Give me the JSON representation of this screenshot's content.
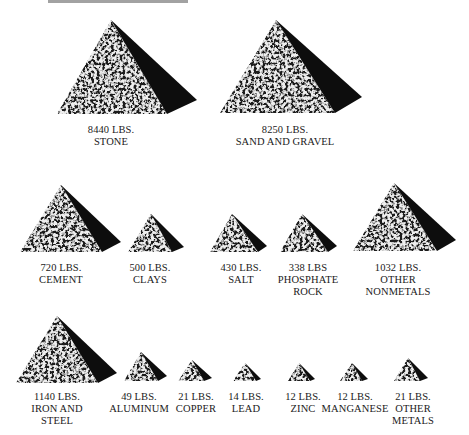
{
  "title": {
    "visible_text": "",
    "note": "cropped off top edge"
  },
  "colors": {
    "background": "#ffffff",
    "text": "#1a1a1a",
    "pyramid_shadow": "#0d0d0d",
    "pyramid_texture_light": "#e8e8e8",
    "pyramid_texture_dark": "#1c1c1c"
  },
  "unit": "LBS.",
  "rows": [
    {
      "items": [
        {
          "id": "stone",
          "amount": "8440 LBS.",
          "name_lines": [
            "STONE"
          ],
          "value": 8440,
          "apex": [
            111,
            20
          ],
          "left": [
            57,
            114
          ],
          "front": [
            167,
            114
          ],
          "back": [
            197,
            100
          ],
          "label_x": 111,
          "label_y": 124
        },
        {
          "id": "sand-and-gravel",
          "amount": "8250 LBS.",
          "name_lines": [
            "SAND AND GRAVEL"
          ],
          "value": 8250,
          "apex": [
            276,
            20
          ],
          "left": [
            220,
            113
          ],
          "front": [
            335,
            113
          ],
          "back": [
            362,
            97
          ],
          "label_x": 285,
          "label_y": 124
        }
      ]
    },
    {
      "items": [
        {
          "id": "cement",
          "amount": "720 LBS.",
          "name_lines": [
            "CEMENT"
          ],
          "value": 720,
          "apex": [
            61,
            185
          ],
          "left": [
            20,
            252
          ],
          "front": [
            102,
            252
          ],
          "back": [
            121,
            242
          ],
          "label_x": 61,
          "label_y": 262
        },
        {
          "id": "clays",
          "amount": "500 LBS.",
          "name_lines": [
            "CLAYS"
          ],
          "value": 500,
          "apex": [
            151,
            214
          ],
          "left": [
            128,
            252
          ],
          "front": [
            172,
            252
          ],
          "back": [
            184,
            247
          ],
          "label_x": 150,
          "label_y": 262
        },
        {
          "id": "salt",
          "amount": "430 LBS.",
          "name_lines": [
            "SALT"
          ],
          "value": 430,
          "apex": [
            232,
            214
          ],
          "left": [
            210,
            252
          ],
          "front": [
            258,
            252
          ],
          "back": [
            267,
            246
          ],
          "label_x": 241,
          "label_y": 262
        },
        {
          "id": "phosphate-rock",
          "amount": "338 LBS",
          "name_lines": [
            "PHOSPHATE",
            "ROCK"
          ],
          "value": 338,
          "apex": [
            302,
            214
          ],
          "left": [
            280,
            252
          ],
          "front": [
            328,
            252
          ],
          "back": [
            337,
            246
          ],
          "label_x": 308,
          "label_y": 262
        },
        {
          "id": "other-nonmetals",
          "amount": "1032 LBS.",
          "name_lines": [
            "OTHER",
            "NONMETALS"
          ],
          "value": 1032,
          "apex": [
            394,
            183
          ],
          "left": [
            353,
            251
          ],
          "front": [
            437,
            251
          ],
          "back": [
            456,
            240
          ],
          "label_x": 398,
          "label_y": 262
        }
      ]
    },
    {
      "items": [
        {
          "id": "iron-and-steel",
          "amount": "1140 LBS.",
          "name_lines": [
            "IRON AND",
            "STEEL"
          ],
          "value": 1140,
          "apex": [
            57,
            316
          ],
          "left": [
            16,
            383
          ],
          "front": [
            98,
            383
          ],
          "back": [
            117,
            373
          ],
          "label_x": 57,
          "label_y": 391
        },
        {
          "id": "aluminum",
          "amount": "49 LBS.",
          "name_lines": [
            "ALUMINUM"
          ],
          "value": 49,
          "apex": [
            141,
            352
          ],
          "left": [
            124,
            381
          ],
          "front": [
            158,
            381
          ],
          "back": [
            167,
            376
          ],
          "label_x": 139,
          "label_y": 391
        },
        {
          "id": "copper",
          "amount": "21 LBS.",
          "name_lines": [
            "COPPER"
          ],
          "value": 21,
          "apex": [
            192,
            360
          ],
          "left": [
            178,
            381
          ],
          "front": [
            204,
            381
          ],
          "back": [
            212,
            378
          ],
          "label_x": 196,
          "label_y": 391
        },
        {
          "id": "lead",
          "amount": "14 LBS.",
          "name_lines": [
            "LEAD"
          ],
          "value": 14,
          "apex": [
            245,
            363
          ],
          "left": [
            233,
            381
          ],
          "front": [
            256,
            381
          ],
          "back": [
            261,
            379
          ],
          "label_x": 246,
          "label_y": 391
        },
        {
          "id": "zinc",
          "amount": "12 LBS.",
          "name_lines": [
            "ZINC"
          ],
          "value": 12,
          "apex": [
            299,
            363
          ],
          "left": [
            288,
            381
          ],
          "front": [
            310,
            381
          ],
          "back": [
            315,
            379
          ],
          "label_x": 303,
          "label_y": 391
        },
        {
          "id": "manganese",
          "amount": "12 LBS.",
          "name_lines": [
            "MANGANESE"
          ],
          "value": 12,
          "apex": [
            352,
            363
          ],
          "left": [
            340,
            381
          ],
          "front": [
            362,
            381
          ],
          "back": [
            368,
            379
          ],
          "label_x": 355,
          "label_y": 391
        },
        {
          "id": "other-metals",
          "amount": "21 LBS.",
          "name_lines": [
            "OTHER",
            "METALS"
          ],
          "value": 21,
          "apex": [
            408,
            358
          ],
          "left": [
            394,
            381
          ],
          "front": [
            420,
            381
          ],
          "back": [
            428,
            378
          ],
          "label_x": 413,
          "label_y": 391
        }
      ]
    }
  ]
}
